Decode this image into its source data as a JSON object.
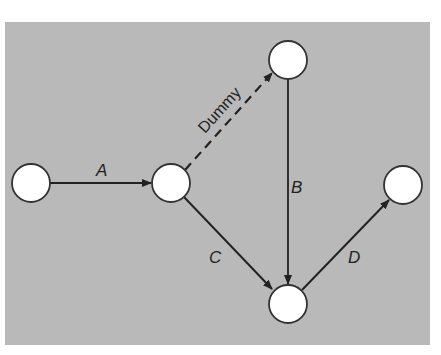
{
  "diagram": {
    "type": "activity-on-arrow network",
    "background_color": "#b9b9b9",
    "nodes": [
      {
        "id": "n1",
        "x": 31,
        "y": 183
      },
      {
        "id": "n2",
        "x": 171,
        "y": 183
      },
      {
        "id": "n3",
        "x": 288,
        "y": 60
      },
      {
        "id": "n4",
        "x": 403,
        "y": 185
      },
      {
        "id": "n5",
        "x": 288,
        "y": 304
      }
    ],
    "edges": [
      {
        "from": "n1",
        "to": "n2",
        "label": "A",
        "style": "solid"
      },
      {
        "from": "n2",
        "to": "n3",
        "label": "Dummy",
        "style": "dashed"
      },
      {
        "from": "n3",
        "to": "n5",
        "label": "B",
        "style": "solid"
      },
      {
        "from": "n2",
        "to": "n5",
        "label": "C",
        "style": "solid"
      },
      {
        "from": "n5",
        "to": "n4",
        "label": "D",
        "style": "solid"
      }
    ],
    "labels": {
      "a": "A",
      "dummy": "Dummy",
      "b": "B",
      "c": "C",
      "d": "D"
    }
  }
}
